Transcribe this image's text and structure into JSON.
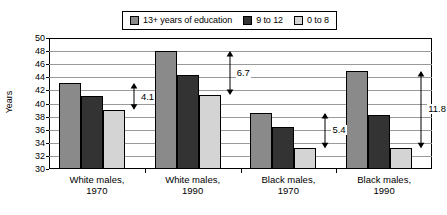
{
  "chart_data": {
    "type": "bar",
    "title": "",
    "xlabel": "",
    "ylabel": "Years",
    "ylim": [
      30,
      50
    ],
    "ytick_step": 2,
    "yticks": [
      30,
      32,
      34,
      36,
      38,
      40,
      42,
      44,
      46,
      48,
      50
    ],
    "grid": true,
    "legend_position": "top-center",
    "categories": [
      "White males, 1970",
      "White males, 1990",
      "Black males, 1970",
      "Black males, 1990"
    ],
    "category_lines": [
      [
        "White males,",
        "1970"
      ],
      [
        "White males,",
        "1990"
      ],
      [
        "Black males,",
        "1970"
      ],
      [
        "Black males,",
        "1990"
      ]
    ],
    "series": [
      {
        "name": "13+ years of education",
        "color": "#8a8a8a",
        "values": [
          43.1,
          48.0,
          38.6,
          45.0
        ]
      },
      {
        "name": "9 to 12",
        "color": "#333333",
        "values": [
          41.1,
          44.3,
          36.4,
          38.2
        ]
      },
      {
        "name": "0 to 8",
        "color": "#d4d4d4",
        "values": [
          39.0,
          41.3,
          33.2,
          33.2
        ]
      }
    ],
    "annotations": [
      {
        "category": "White males, 1970",
        "label": "4.1",
        "from": 43.1,
        "to": 39.0
      },
      {
        "category": "White males, 1990",
        "label": "6.7",
        "from": 48.0,
        "to": 41.3
      },
      {
        "category": "Black males, 1970",
        "label": "5.4",
        "from": 38.6,
        "to": 33.2
      },
      {
        "category": "Black males, 1990",
        "label": "11.8",
        "from": 45.0,
        "to": 33.2
      }
    ]
  },
  "legend": {
    "items": [
      {
        "label": "13+ years of education",
        "color": "#8a8a8a"
      },
      {
        "label": "9 to 12",
        "color": "#333333"
      },
      {
        "label": "0 to 8",
        "color": "#d4d4d4"
      }
    ]
  },
  "axis": {
    "y_title": "Years",
    "y_labels": [
      "50",
      "48",
      "46",
      "44",
      "42",
      "40",
      "38",
      "36",
      "34",
      "32",
      "30"
    ]
  }
}
